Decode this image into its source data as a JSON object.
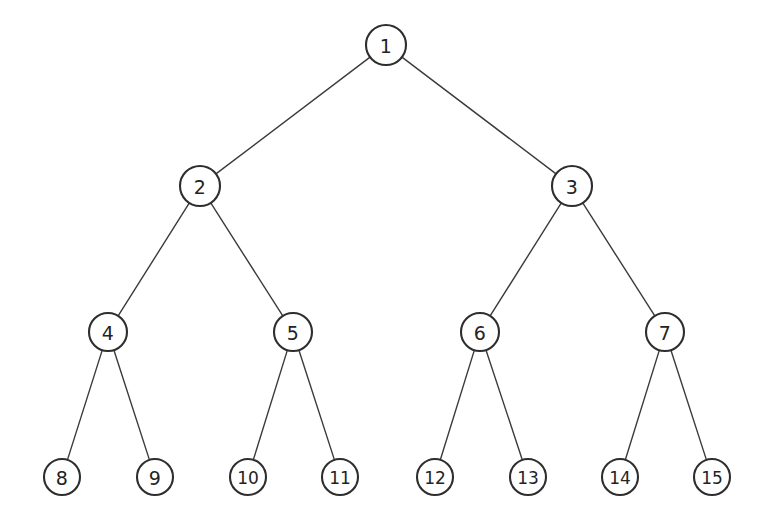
{
  "diagram": {
    "type": "tree-diagram",
    "background_color": "#ffffff",
    "node_fill_color": "#ffffff",
    "node_stroke_color": "#2e2e2e",
    "edge_color": "#3b3b3b",
    "label_color": "#232323"
  },
  "chart_data": {
    "type": "tree",
    "levels": 4,
    "node_count": 15,
    "edge_count": 14,
    "nodes": [
      {
        "id": 1,
        "label": "1",
        "x": 386,
        "y": 45,
        "r": 20,
        "level": 0,
        "parent": null
      },
      {
        "id": 2,
        "label": "2",
        "x": 200,
        "y": 186,
        "r": 20,
        "level": 1,
        "parent": 1
      },
      {
        "id": 3,
        "label": "3",
        "x": 572,
        "y": 186,
        "r": 20,
        "level": 1,
        "parent": 1
      },
      {
        "id": 4,
        "label": "4",
        "x": 108,
        "y": 332,
        "r": 19,
        "level": 2,
        "parent": 2
      },
      {
        "id": 5,
        "label": "5",
        "x": 293,
        "y": 332,
        "r": 19,
        "level": 2,
        "parent": 2
      },
      {
        "id": 6,
        "label": "6",
        "x": 480,
        "y": 332,
        "r": 19,
        "level": 2,
        "parent": 3
      },
      {
        "id": 7,
        "label": "7",
        "x": 665,
        "y": 332,
        "r": 19,
        "level": 2,
        "parent": 3
      },
      {
        "id": 8,
        "label": "8",
        "x": 62,
        "y": 477,
        "r": 18,
        "level": 3,
        "parent": 4
      },
      {
        "id": 9,
        "label": "9",
        "x": 155,
        "y": 477,
        "r": 18,
        "level": 3,
        "parent": 4
      },
      {
        "id": 10,
        "label": "10",
        "x": 248,
        "y": 477,
        "r": 18,
        "level": 3,
        "parent": 5
      },
      {
        "id": 11,
        "label": "11",
        "x": 340,
        "y": 477,
        "r": 18,
        "level": 3,
        "parent": 5
      },
      {
        "id": 12,
        "label": "12",
        "x": 435,
        "y": 477,
        "r": 18,
        "level": 3,
        "parent": 6
      },
      {
        "id": 13,
        "label": "13",
        "x": 528,
        "y": 477,
        "r": 18,
        "level": 3,
        "parent": 6
      },
      {
        "id": 14,
        "label": "14",
        "x": 620,
        "y": 477,
        "r": 18,
        "level": 3,
        "parent": 7
      },
      {
        "id": 15,
        "label": "15",
        "x": 712,
        "y": 477,
        "r": 18,
        "level": 3,
        "parent": 7
      }
    ],
    "edges": [
      {
        "from": 1,
        "to": 2
      },
      {
        "from": 1,
        "to": 3
      },
      {
        "from": 2,
        "to": 4
      },
      {
        "from": 2,
        "to": 5
      },
      {
        "from": 3,
        "to": 6
      },
      {
        "from": 3,
        "to": 7
      },
      {
        "from": 4,
        "to": 8
      },
      {
        "from": 4,
        "to": 9
      },
      {
        "from": 5,
        "to": 10
      },
      {
        "from": 5,
        "to": 11
      },
      {
        "from": 6,
        "to": 12
      },
      {
        "from": 6,
        "to": 13
      },
      {
        "from": 7,
        "to": 14
      },
      {
        "from": 7,
        "to": 15
      }
    ]
  }
}
